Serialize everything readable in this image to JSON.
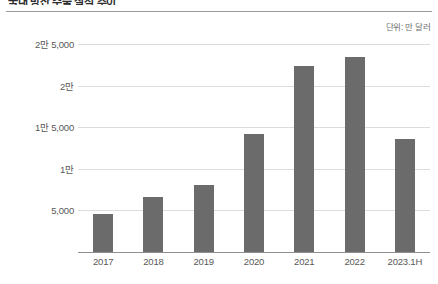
{
  "headline": "국내 방산 수출 실적 추이",
  "unit_caption": "단위: 만 달러",
  "chart_data": {
    "type": "bar",
    "title": "국내 방산 수출 실적 추이",
    "xlabel": "",
    "ylabel": "",
    "unit": "만 달러",
    "categories": [
      "2017",
      "2018",
      "2019",
      "2020",
      "2021",
      "2022",
      "2023.1H"
    ],
    "values": [
      4600,
      6650,
      8000,
      14200,
      22400,
      23400,
      13600
    ],
    "ylim": [
      0,
      25000
    ],
    "yticks": [
      5000,
      10000,
      15000,
      20000,
      25000
    ],
    "ytick_labels": [
      "5,000",
      "1만",
      "1만 5,000",
      "2만",
      "2만 5,000"
    ],
    "grid": true,
    "legend": "none",
    "bar_color": "#6b6b6b",
    "gridline_color": "#dcdcdc",
    "axis_color": "#8f8f8f"
  }
}
